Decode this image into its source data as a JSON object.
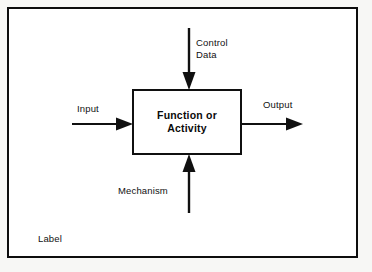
{
  "diagram": {
    "type": "IDEF0 / SADT activity box",
    "corner_label": "Label",
    "process_box": {
      "name": "function-or-activity-box",
      "text": "Function  or\nActivity"
    },
    "arrows": [
      {
        "name": "control-arrow",
        "label": "Control\nData",
        "direction": "down",
        "role": "control",
        "enters": "top"
      },
      {
        "name": "input-arrow",
        "label": "Input",
        "direction": "right",
        "role": "input",
        "enters": "left"
      },
      {
        "name": "output-arrow",
        "label": "Output",
        "direction": "right",
        "role": "output",
        "exits": "right"
      },
      {
        "name": "mechanism-arrow",
        "label": "Mechanism",
        "direction": "up",
        "role": "mechanism",
        "enters": "bottom"
      }
    ],
    "colors": {
      "ink": "#101010",
      "paper": "#ffffff",
      "page_background": "#f7f7f5"
    }
  }
}
